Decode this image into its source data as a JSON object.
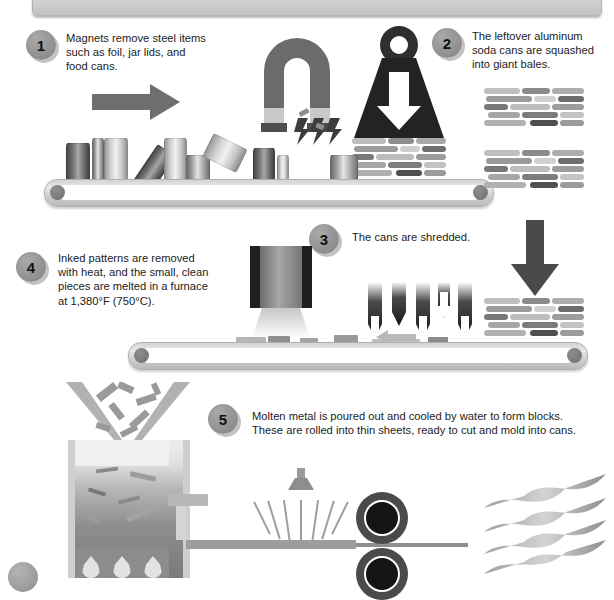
{
  "header": {
    "title": "HOW FROZEN CANS ARE RECYCLED INTO NEW CANS"
  },
  "steps": [
    {
      "number": "1",
      "text": "Magnets remove steel items such as foil, jar lids, and food cans.",
      "lines": [
        "Magnets remove steel items",
        "such as foil, jar lids, and",
        "food cans."
      ]
    },
    {
      "number": "2",
      "text": "The leftover aluminum soda cans are squashed into giant bales.",
      "lines": [
        "The leftover aluminum",
        "soda cans are squashed",
        "into giant bales."
      ]
    },
    {
      "number": "3",
      "text": "The cans are shredded.",
      "lines": [
        "The cans are shredded."
      ]
    },
    {
      "number": "4",
      "text": "Inked patterns are removed with heat, and the small, clean pieces are melted in a furnace at 1,380°F (750°C).",
      "lines": [
        "Inked patterns are removed",
        "with heat, and the small, clean",
        "pieces are melted in a furnace",
        "at 1,380°F (750°C)."
      ]
    },
    {
      "number": "5",
      "text": "Molten metal is poured out and cooled by water to form blocks. These are rolled into thin sheets, ready to cut and mold into cans.",
      "lines": [
        "Molten metal is poured out and cooled by water to form blocks.",
        "These are rolled into thin sheets, ready to cut and mold into cans."
      ]
    },
    {
      "number": "6",
      "text": "",
      "lines": []
    }
  ],
  "icons": {
    "magnet": "horseshoe-magnet-icon",
    "weight": "weight-icon",
    "down_arrow": "down-arrow-icon",
    "right_arrow": "right-arrow-icon",
    "shredder_blade": "shredder-blade-icon",
    "printer": "heat-printer-icon",
    "furnace": "furnace-icon",
    "water_nozzle": "water-spray-nozzle-icon",
    "roller": "rotating-roller-icon",
    "sheets": "metal-sheet-stack-icon",
    "lightning": "lightning-spark-icon"
  },
  "colors": {
    "banner_bg": "#cfcfcf",
    "banner_text": "#ffffff",
    "badge_fill": "#8e8e8e",
    "belt": "#d4d4d4",
    "dark_metal": "#4a4a4a",
    "mid_metal": "#8d8d8d",
    "light_metal": "#e2e2e2",
    "text": "#1c1c1c"
  },
  "temperature": {
    "fahrenheit": "1,380°F",
    "celsius": "750°C"
  }
}
